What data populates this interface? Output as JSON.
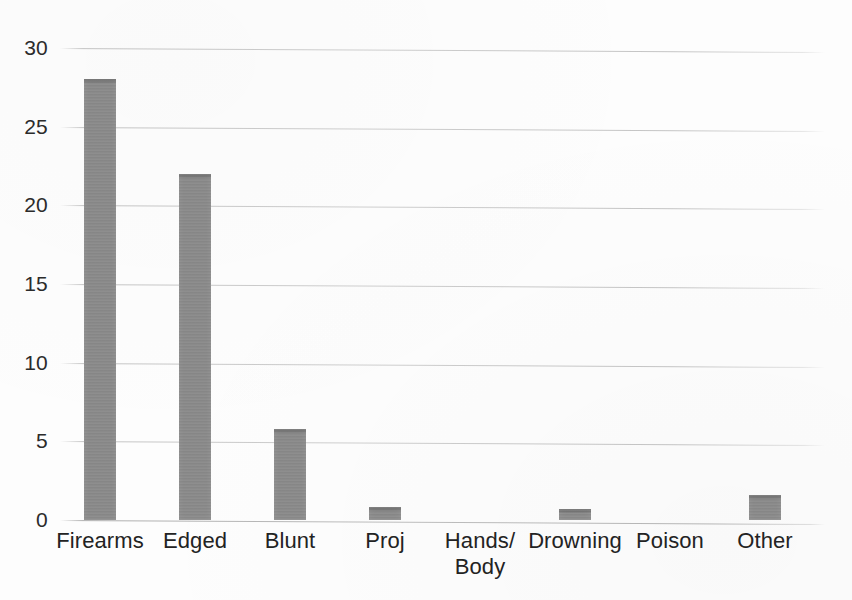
{
  "chart_data": {
    "type": "bar",
    "title": "",
    "subtitle": "",
    "xlabel": "",
    "ylabel": "",
    "categories": [
      "Firearms",
      "Edged",
      "Blunt",
      "Proj",
      "Hands/\nBody",
      "Drowning",
      "Poison",
      "Other"
    ],
    "values": [
      28,
      22,
      5.8,
      0.8,
      0,
      0.7,
      0,
      1.6
    ],
    "ylim": [
      0,
      30
    ],
    "ytick_labels": [
      "0",
      "5",
      "10",
      "15",
      "20",
      "25",
      "30"
    ],
    "ytick_values": [
      0,
      5,
      10,
      15,
      20,
      25,
      30
    ],
    "grid": true,
    "grid_axis": "y",
    "legend": false,
    "legend_position": "none",
    "series": [
      {
        "name": "",
        "values": [
          28,
          22,
          5.8,
          0.8,
          0,
          0.7,
          0,
          1.6
        ]
      }
    ]
  },
  "style": {
    "bar_color": "#8a8a8a",
    "grid_color": "#9a9a9a",
    "text_color": "#232323",
    "background": "#fdfdfd"
  }
}
